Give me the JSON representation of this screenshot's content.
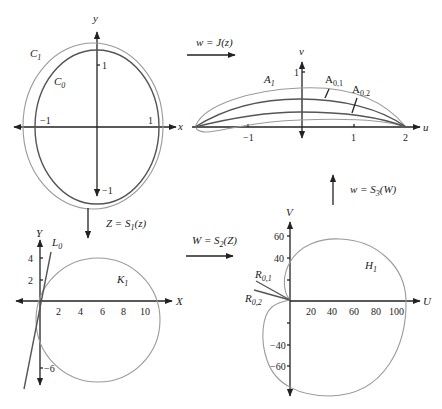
{
  "panels": {
    "top_left": {
      "axis_x": "x",
      "axis_y": "y",
      "ticks_x": [
        "−1",
        "1"
      ],
      "ticks_y": [
        "1",
        "−1"
      ],
      "curves": [
        "C1",
        "C0"
      ],
      "label_c1": "C",
      "sub_c1": "1",
      "label_c0": "C",
      "sub_c0": "0"
    },
    "top_right": {
      "axis_x": "u",
      "axis_y": "v",
      "ticks_x": [
        "−1",
        "1",
        "2"
      ],
      "ticks_y": [
        "1"
      ],
      "label_a1": "A",
      "sub_a1": "1",
      "label_a01": "A",
      "sub_a01": "0,1",
      "label_a02": "A",
      "sub_a02": "0,2"
    },
    "bottom_left": {
      "axis_x": "X",
      "axis_y": "Y",
      "ticks_x": [
        "2",
        "4",
        "6",
        "8",
        "10"
      ],
      "ticks_y": [
        "4",
        "2",
        "−6"
      ],
      "label_l0": "L",
      "sub_l0": "0",
      "label_k1": "K",
      "sub_k1": "1"
    },
    "bottom_right": {
      "axis_x": "U",
      "axis_y": "V",
      "ticks_x": [
        "20",
        "40",
        "60",
        "80",
        "100"
      ],
      "ticks_y": [
        "60",
        "40",
        "−40",
        "−60"
      ],
      "label_h1": "H",
      "sub_h1": "1",
      "label_r01": "R",
      "sub_r01": "0,1",
      "label_r02": "R",
      "sub_r02": "0,2"
    }
  },
  "mappings": {
    "top": {
      "lhs": "w = J(z)"
    },
    "left": {
      "lhs": "Z = S",
      "sub": "1",
      "rhs": "(z)"
    },
    "middle": {
      "lhs": "W = S",
      "sub": "2",
      "rhs": "(Z)"
    },
    "right": {
      "lhs": "w = S",
      "sub": "3",
      "rhs": "(W)"
    }
  },
  "colors": {
    "axis": "#222222",
    "light_curve": "#9a9a9a",
    "dark_curve": "#555555"
  }
}
